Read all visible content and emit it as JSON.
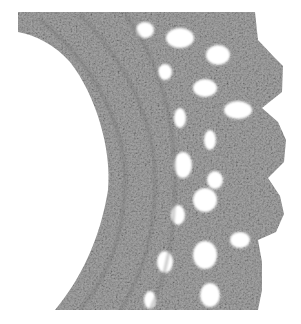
{
  "image": {
    "subject": "crocheted lace edging",
    "description": "Grayscale photograph of a curved crochet lace border with open mesh holes and scalloped picot edge",
    "colors": {
      "background": "#ffffff",
      "yarn_light": "#b8b8b8",
      "yarn_mid": "#9a9a9a",
      "yarn_dark": "#6e6e6e"
    }
  }
}
